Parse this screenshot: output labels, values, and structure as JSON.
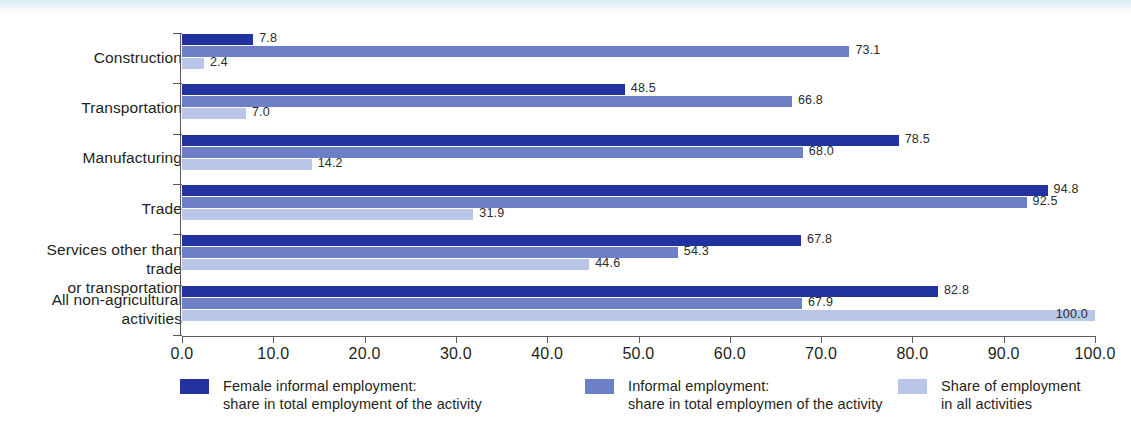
{
  "chart_data": {
    "type": "bar",
    "orientation": "horizontal",
    "grouped": true,
    "title": "",
    "subtitle": "",
    "xlabel": "",
    "ylabel": "",
    "xlim": [
      0.0,
      100.0
    ],
    "grid": false,
    "legend_position": "bottom",
    "xticks": [
      "0.0",
      "10.0",
      "20.0",
      "30.0",
      "40.0",
      "50.0",
      "60.0",
      "70.0",
      "80.0",
      "90.0",
      "100.0"
    ],
    "xtick_values": [
      0,
      10,
      20,
      30,
      40,
      50,
      60,
      70,
      80,
      90,
      100
    ],
    "categories": [
      "Construction",
      "Transportation",
      "Manufacturing",
      "Trade",
      "Services other than trade\nor transportation",
      "All non-agricultural\nactivities"
    ],
    "series": [
      {
        "name": "Female informal employment:\nshare in total employment of the activity",
        "color": "#2233a0",
        "values": [
          7.8,
          48.5,
          78.5,
          94.8,
          67.8,
          82.8
        ],
        "labels": [
          "7.8",
          "48.5",
          "78.5",
          "94.8",
          "67.8",
          "82.8"
        ],
        "label_placement": [
          "outside",
          "outside",
          "outside",
          "outside",
          "outside",
          "outside"
        ]
      },
      {
        "name": "Informal employment:\nshare in total employmen of the activity",
        "color": "#6d7fc6",
        "values": [
          73.1,
          66.8,
          68.0,
          92.5,
          54.3,
          67.9
        ],
        "labels": [
          "73.1",
          "66.8",
          "68.0",
          "92.5",
          "54.3",
          "67.9"
        ],
        "label_placement": [
          "outside",
          "outside",
          "outside",
          "outside",
          "outside",
          "outside"
        ]
      },
      {
        "name": "Share of employment\nin all activities",
        "color": "#bac6e7",
        "values": [
          2.4,
          7.0,
          14.2,
          31.9,
          44.6,
          100.0
        ],
        "labels": [
          "2.4",
          "7.0",
          "14.2",
          "31.9",
          "44.6",
          "100.0"
        ],
        "label_placement": [
          "outside",
          "outside",
          "outside",
          "outside",
          "outside",
          "inside"
        ]
      }
    ]
  },
  "legend": {
    "entries": [
      {
        "label": "Female informal employment:\nshare in total employment of the activity",
        "color": "#2233a0"
      },
      {
        "label": "Informal employment:\nshare in total employmen of the activity",
        "color": "#6d7fc6"
      },
      {
        "label": "Share of employment\nin all activities",
        "color": "#bac6e7"
      }
    ]
  }
}
